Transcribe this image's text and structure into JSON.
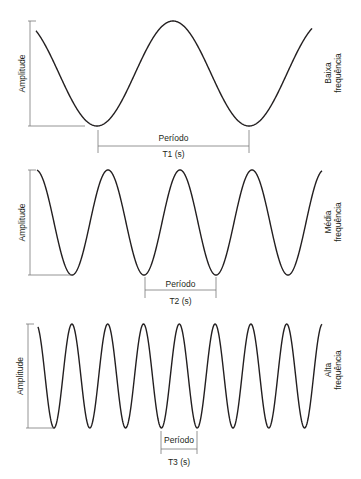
{
  "colors": {
    "wave": "#231f20",
    "guide": "#7a7a7a",
    "text": "#231f20",
    "background": "#ffffff"
  },
  "panels": [
    {
      "id": "low",
      "amplitude_label": "Amplitude",
      "frequency_label_line1": "Baixa",
      "frequency_label_line2": "frequência",
      "period_label": "Período",
      "period_symbol": "T1 (s)",
      "wave": {
        "x_start": 36,
        "x_end": 312,
        "y_top": 21,
        "y_bottom": 126,
        "period": 152,
        "first_trough_x": 97
      },
      "amp_bar": {
        "x": 30,
        "y_top": 21,
        "y_bottom": 126,
        "bottom_ext": 85
      },
      "period_marker": {
        "x1": 98,
        "x2": 249,
        "y_tick_top": 130,
        "y_tick_bottom": 153,
        "y_line": 146,
        "y_label": 141,
        "y_symbol": 157
      },
      "freq_label_x": 331,
      "freq_label_y": 73
    },
    {
      "id": "medium",
      "amplitude_label": "Amplitude",
      "frequency_label_line1": "Média",
      "frequency_label_line2": "frequência",
      "period_label": "Período",
      "period_symbol": "T2 (s)",
      "wave": {
        "x_start": 37,
        "x_end": 322,
        "y_top": 170,
        "y_bottom": 275,
        "period": 72,
        "first_trough_x": 72
      },
      "amp_bar": {
        "x": 30,
        "y_top": 170,
        "y_bottom": 275,
        "bottom_ext": 72
      },
      "period_marker": {
        "x1": 145,
        "x2": 216,
        "y_tick_top": 277,
        "y_tick_bottom": 298,
        "y_line": 290,
        "y_label": 287,
        "y_symbol": 304
      },
      "freq_label_x": 331,
      "freq_label_y": 222
    },
    {
      "id": "high",
      "amplitude_label": "Amplitude",
      "frequency_label_line1": "Alta",
      "frequency_label_line2": "frequência",
      "period_label": "Período",
      "period_symbol": "T3 (s)",
      "wave": {
        "x_start": 38,
        "x_end": 322,
        "y_top": 324,
        "y_bottom": 428,
        "period": 35.8,
        "first_trough_x": 54
      },
      "amp_bar": {
        "x": 28,
        "y_top": 324,
        "y_bottom": 428,
        "bottom_ext": 54
      },
      "period_marker": {
        "x1": 161,
        "x2": 197,
        "y_tick_top": 431,
        "y_tick_bottom": 454,
        "y_line": 449,
        "y_label": 443,
        "y_symbol": 465
      },
      "freq_label_x": 331,
      "freq_label_y": 370
    }
  ]
}
